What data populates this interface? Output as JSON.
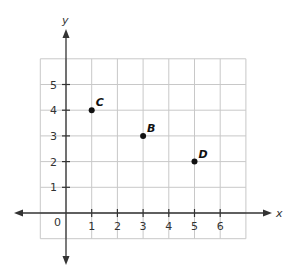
{
  "chart_data": {
    "type": "scatter",
    "title": "",
    "xlabel": "x",
    "ylabel": "y",
    "xlim": [
      -1,
      7
    ],
    "ylim": [
      -1,
      6
    ],
    "grid": true,
    "x_ticks": [
      1,
      2,
      3,
      4,
      5,
      6
    ],
    "y_ticks": [
      1,
      2,
      3,
      4,
      5
    ],
    "origin_label": "0",
    "points": [
      {
        "label": "C",
        "x": 1,
        "y": 4
      },
      {
        "label": "B",
        "x": 3,
        "y": 3
      },
      {
        "label": "D",
        "x": 5,
        "y": 2
      }
    ]
  },
  "colors": {
    "grid": "#c8c8c8",
    "axis": "#333333",
    "point": "#111111"
  }
}
